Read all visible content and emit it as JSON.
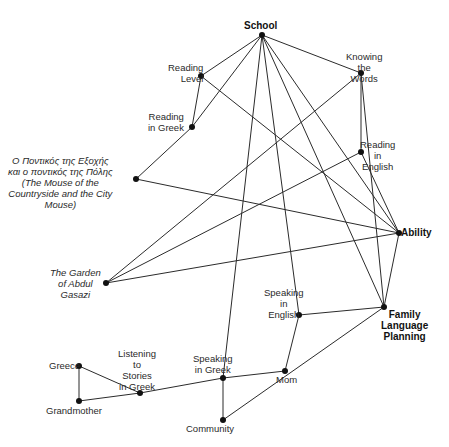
{
  "diagram": {
    "type": "network",
    "nodes": [
      {
        "id": "school",
        "label": "School",
        "x": 262,
        "y": 35,
        "lx": 244,
        "ly": 20,
        "style": "bold",
        "align": "center"
      },
      {
        "id": "reading_level",
        "label": "Reading\nLevel",
        "x": 201,
        "y": 76,
        "lx": 168,
        "ly": 62,
        "style": "normal",
        "align": "right"
      },
      {
        "id": "reading_greek",
        "label": "Reading\nin Greek",
        "x": 192,
        "y": 127,
        "lx": 148,
        "ly": 111,
        "style": "normal",
        "align": "right"
      },
      {
        "id": "knowing_words",
        "label": "Knowing\nthe\nWords",
        "x": 361,
        "y": 73,
        "lx": 346,
        "ly": 51,
        "style": "normal",
        "align": "center"
      },
      {
        "id": "reading_english",
        "label": "Reading\nin\nEnglish",
        "x": 361,
        "y": 152,
        "lx": 360,
        "ly": 139,
        "style": "normal",
        "align": "center"
      },
      {
        "id": "mouse",
        "label": "Ο Ποντικός της Εξοχής\nκαι ο ποντικός της Πόλης\n(The Mouse of the\nCountryside and the City\nMouse)",
        "x": 136,
        "y": 179,
        "lx": 8,
        "ly": 155,
        "style": "italic",
        "align": "center"
      },
      {
        "id": "ability",
        "label": "Ability",
        "x": 399,
        "y": 233,
        "lx": 401,
        "ly": 227,
        "style": "bold",
        "align": "left"
      },
      {
        "id": "garden",
        "label": "The Garden\nof Abdul\nGasazi",
        "x": 106,
        "y": 283,
        "lx": 50,
        "ly": 267,
        "style": "italic",
        "align": "center"
      },
      {
        "id": "speaking_english",
        "label": "Speaking\nin\nEnglish",
        "x": 299,
        "y": 315,
        "lx": 264,
        "ly": 287,
        "style": "normal",
        "align": "center"
      },
      {
        "id": "flp",
        "label": "Family\nLanguage\nPlanning",
        "x": 384,
        "y": 307,
        "lx": 381,
        "ly": 309,
        "style": "bold",
        "align": "center"
      },
      {
        "id": "speaking_greek",
        "label": "Speaking\nin Greek",
        "x": 223,
        "y": 378,
        "lx": 193,
        "ly": 353,
        "style": "normal",
        "align": "center"
      },
      {
        "id": "mom",
        "label": "Mom",
        "x": 285,
        "y": 371,
        "lx": 276,
        "ly": 374,
        "style": "normal",
        "align": "center"
      },
      {
        "id": "community",
        "label": "Community",
        "x": 223,
        "y": 420,
        "lx": 186,
        "ly": 423,
        "style": "normal",
        "align": "center"
      },
      {
        "id": "listening",
        "label": "Listening\nto\nStories\nin Greek",
        "x": 140,
        "y": 393,
        "lx": 118,
        "ly": 348,
        "style": "normal",
        "align": "center"
      },
      {
        "id": "greece",
        "label": "Greece",
        "x": 79,
        "y": 366,
        "lx": 49,
        "ly": 360,
        "style": "normal",
        "align": "left"
      },
      {
        "id": "grandmother",
        "label": "Grandmother",
        "x": 79,
        "y": 401,
        "lx": 46,
        "ly": 405,
        "style": "normal",
        "align": "center"
      }
    ],
    "edges": [
      [
        "school",
        "reading_level"
      ],
      [
        "school",
        "reading_greek"
      ],
      [
        "school",
        "knowing_words"
      ],
      [
        "school",
        "speaking_greek"
      ],
      [
        "school",
        "speaking_english"
      ],
      [
        "school",
        "flp"
      ],
      [
        "school",
        "ability"
      ],
      [
        "reading_level",
        "reading_greek"
      ],
      [
        "reading_level",
        "ability"
      ],
      [
        "reading_greek",
        "mouse"
      ],
      [
        "mouse",
        "ability"
      ],
      [
        "knowing_words",
        "reading_english"
      ],
      [
        "knowing_words",
        "garden"
      ],
      [
        "knowing_words",
        "flp"
      ],
      [
        "reading_english",
        "garden"
      ],
      [
        "reading_english",
        "ability"
      ],
      [
        "garden",
        "ability"
      ],
      [
        "ability",
        "flp"
      ],
      [
        "speaking_english",
        "flp"
      ],
      [
        "speaking_english",
        "mom"
      ],
      [
        "flp",
        "community"
      ],
      [
        "mom",
        "speaking_greek"
      ],
      [
        "speaking_greek",
        "community"
      ],
      [
        "speaking_greek",
        "listening"
      ],
      [
        "listening",
        "greece"
      ],
      [
        "listening",
        "grandmother"
      ],
      [
        "greece",
        "grandmother"
      ]
    ],
    "colors": {
      "line": "#2b2b2b",
      "dot": "#111111",
      "text": "#2a2a2a",
      "background": "#ffffff"
    }
  }
}
